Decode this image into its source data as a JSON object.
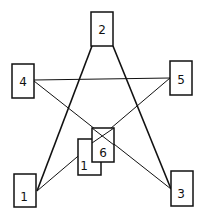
{
  "diagram": {
    "type": "pentagram-node-graph",
    "nodes": [
      {
        "id": "node-2",
        "label": "2",
        "x": 91,
        "y": 12,
        "w": 22,
        "h": 34
      },
      {
        "id": "node-4",
        "label": "4",
        "x": 12,
        "y": 64,
        "w": 22,
        "h": 34
      },
      {
        "id": "node-5",
        "label": "5",
        "x": 170,
        "y": 61,
        "w": 22,
        "h": 34
      },
      {
        "id": "node-1-back",
        "label": "1",
        "x": 78,
        "y": 139,
        "w": 23,
        "h": 36
      },
      {
        "id": "node-6",
        "label": "6",
        "x": 92,
        "y": 128,
        "w": 22,
        "h": 34
      },
      {
        "id": "node-1",
        "label": "1",
        "x": 14,
        "y": 174,
        "w": 22,
        "h": 33
      },
      {
        "id": "node-3",
        "label": "3",
        "x": 171,
        "y": 171,
        "w": 22,
        "h": 35
      }
    ],
    "edges": [
      {
        "from": "2",
        "to": "1",
        "x1": 92,
        "y1": 46,
        "x2": 37,
        "y2": 191,
        "weight": "thick"
      },
      {
        "from": "2",
        "to": "3",
        "x1": 113,
        "y1": 46,
        "x2": 171,
        "y2": 189,
        "weight": "thick"
      },
      {
        "from": "4",
        "to": "5",
        "x1": 34,
        "y1": 80,
        "x2": 170,
        "y2": 78,
        "weight": "thin"
      },
      {
        "from": "4",
        "to": "3",
        "x1": 34,
        "y1": 81,
        "x2": 171,
        "y2": 189,
        "weight": "thin"
      },
      {
        "from": "5",
        "to": "1",
        "x1": 170,
        "y1": 78,
        "x2": 37,
        "y2": 191,
        "weight": "thin"
      }
    ]
  }
}
